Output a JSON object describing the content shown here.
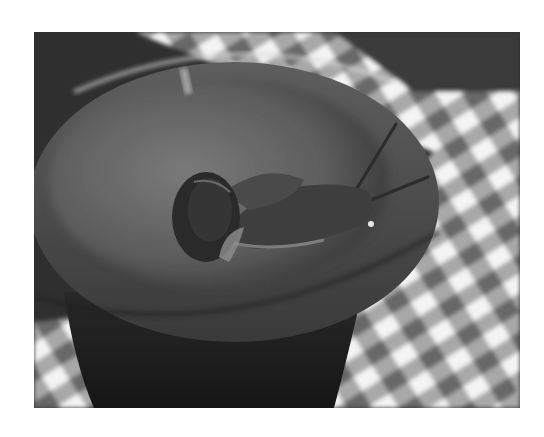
{
  "image": {
    "alt": "Black-and-white photo of a garden snail crawling over the rim of a clay flower pot on a checkered tablecloth",
    "subject": "snail",
    "objects": [
      "snail",
      "clay-pot",
      "checkered-tablecloth"
    ],
    "style": "grayscale",
    "colors": {
      "border": "#ffffff",
      "background_dark": "#2e2e2e",
      "pot_rim": "#5a5a5a",
      "pot_inner": "#6e6e6e",
      "pot_body": "#1e1e1e",
      "check_light": "#f2f2f2",
      "check_mid": "#a8a8a8",
      "check_dark": "#6a6a6a",
      "snail_body": "#3c3c3c",
      "snail_shell": "#2a2a2a"
    }
  }
}
